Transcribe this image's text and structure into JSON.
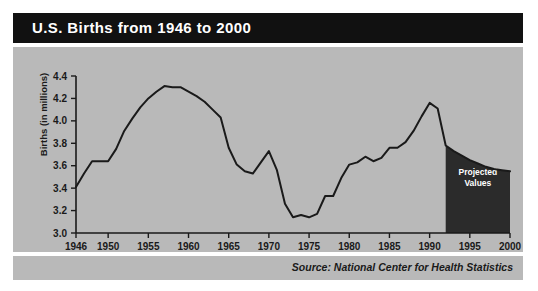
{
  "header": {
    "title": "U.S. Births from 1946 to 2000"
  },
  "footer": {
    "source": "Source: National Center for Health Statistics"
  },
  "colors": {
    "title_band": "#111111",
    "panel_background": "#b9b9b9",
    "line": "#1a1a1a",
    "projected_fill": "#2b2b2b",
    "projected_label": "#ffffff"
  },
  "annotations": {
    "projected_line1": "Projected",
    "projected_line2": "Values"
  },
  "chart_data": {
    "type": "line",
    "title": "U.S. Births from 1946 to 2000",
    "xlabel": "",
    "ylabel": "Births (in millions)",
    "xlim": [
      1946,
      2000
    ],
    "ylim": [
      3.0,
      4.4
    ],
    "grid": false,
    "legend": "none",
    "ytick_labels": [
      "4.4",
      "4.2",
      "4.0",
      "3.8",
      "3.6",
      "3.4",
      "3.2",
      "3.0"
    ],
    "ytick_values": [
      4.4,
      4.2,
      4.0,
      3.8,
      3.6,
      3.4,
      3.2,
      3.0
    ],
    "xtick_labels": [
      "1946",
      "1950",
      "1955",
      "1960",
      "1965",
      "1970",
      "1975",
      "1980",
      "1985",
      "1990",
      "1995",
      "2000"
    ],
    "xtick_values": [
      1946,
      1950,
      1955,
      1960,
      1965,
      1970,
      1975,
      1980,
      1985,
      1990,
      1995,
      2000
    ],
    "x": [
      1946,
      1947,
      1948,
      1949,
      1950,
      1951,
      1952,
      1953,
      1954,
      1955,
      1956,
      1957,
      1958,
      1959,
      1960,
      1961,
      1962,
      1963,
      1964,
      1965,
      1966,
      1967,
      1968,
      1969,
      1970,
      1971,
      1972,
      1973,
      1974,
      1975,
      1976,
      1977,
      1978,
      1979,
      1980,
      1981,
      1982,
      1983,
      1984,
      1985,
      1986,
      1987,
      1988,
      1989,
      1990,
      1991,
      1992
    ],
    "values": [
      3.41,
      3.53,
      3.64,
      3.64,
      3.64,
      3.75,
      3.91,
      4.02,
      4.12,
      4.2,
      4.26,
      4.31,
      4.3,
      4.3,
      4.26,
      4.22,
      4.17,
      4.1,
      4.03,
      3.76,
      3.61,
      3.55,
      3.53,
      3.63,
      3.73,
      3.56,
      3.26,
      3.14,
      3.16,
      3.14,
      3.17,
      3.33,
      3.33,
      3.49,
      3.61,
      3.63,
      3.68,
      3.64,
      3.67,
      3.76,
      3.76,
      3.81,
      3.91,
      4.04,
      4.16,
      4.11,
      3.78
    ],
    "projected": {
      "label": "Projected Values",
      "x": [
        1992,
        1993,
        1994,
        1995,
        1996,
        1997,
        1998,
        1999,
        2000
      ],
      "values": [
        3.78,
        3.73,
        3.69,
        3.65,
        3.62,
        3.59,
        3.57,
        3.56,
        3.55
      ],
      "shaded": true
    }
  }
}
